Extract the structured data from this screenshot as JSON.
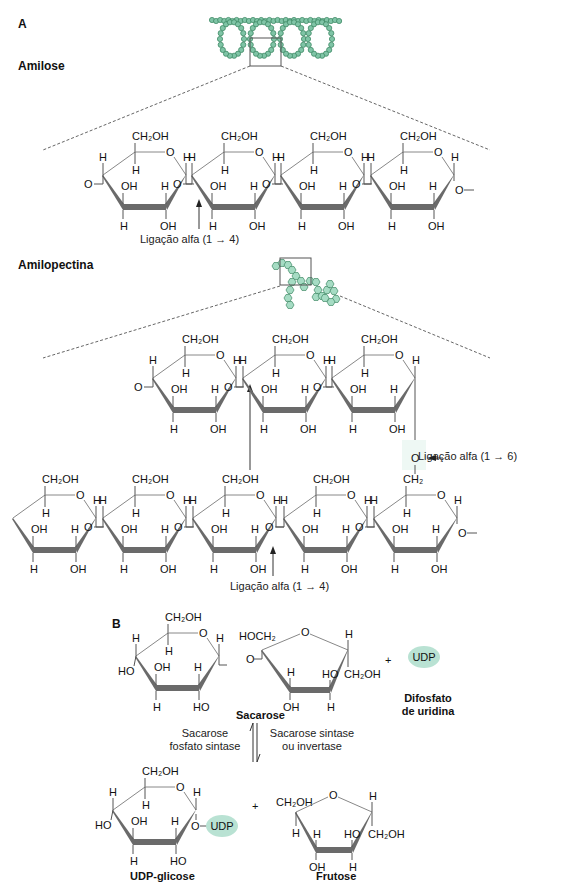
{
  "panel_a": {
    "label": "A",
    "amylose": {
      "title": "Amilose",
      "linkage_label": "Ligação alfa (1 → 4)"
    },
    "amylopectin": {
      "title": "Amilopectina",
      "linkage_14_label": "Ligação alfa (1 → 4)",
      "linkage_16_label": "Ligação alfa (1 → 6)"
    }
  },
  "panel_b": {
    "label": "B",
    "sucrose_label": "Sacarose",
    "udp_badge": "UDP",
    "udp_name_line1": "Difosfato",
    "udp_name_line2": "de uridina",
    "plus": "+",
    "enzyme_left_line1": "Sacarose",
    "enzyme_left_line2": "fosfato sintase",
    "enzyme_right_line1": "Sacarose sintase",
    "enzyme_right_line2": "ou invertase",
    "udp_glucose_label": "UDP-glicose",
    "udp_glucose_badge": "UDP",
    "fructose_label": "Frutose"
  },
  "atoms": {
    "ch2oh": "CH₂OH",
    "ch2": "CH₂",
    "hoch2": "HOCH₂",
    "o": "O",
    "h": "H",
    "oh": "OH",
    "ho": "HO"
  },
  "colors": {
    "helix_fill": "#7fc4a6",
    "helix_stroke": "#3f8a66",
    "pectin_fill": "#a6dcc4",
    "udp_fill": "#b9e2d3",
    "bond": "#555555",
    "thin_bond": "#888888",
    "bold_bond": "#6a6a6a"
  }
}
